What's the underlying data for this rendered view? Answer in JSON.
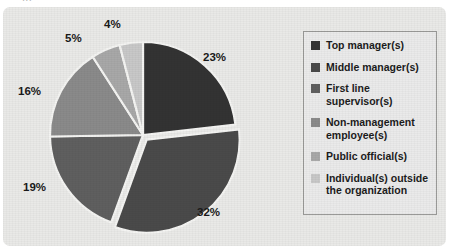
{
  "title_fragment": "...",
  "chart_data": {
    "type": "pie",
    "title": "",
    "xlabel": "",
    "ylabel": "",
    "legend_position": "right",
    "grid": false,
    "explode_index": 1,
    "start_angle_deg": 0,
    "direction": "clockwise",
    "categories": [
      "Top manager(s)",
      "Middle manager(s)",
      "First line supervisor(s)",
      "Non-management employee(s)",
      "Public official(s)",
      "Individual(s) outside the organization"
    ],
    "values": [
      23,
      32,
      19,
      16,
      5,
      4
    ],
    "data_labels": [
      "23%",
      "32%",
      "19%",
      "16%",
      "5%",
      "4%"
    ],
    "colors": [
      "#333333",
      "#4a4a4a",
      "#5f5f5f",
      "#8a8a8a",
      "#a8a8a8",
      "#c8c8c8"
    ]
  },
  "legend": {
    "items": [
      {
        "label": "Top manager(s)",
        "color": "#333333"
      },
      {
        "label": "Middle manager(s)",
        "color": "#4a4a4a"
      },
      {
        "label": "First line supervisor(s)",
        "color": "#5f5f5f"
      },
      {
        "label": "Non-management employee(s)",
        "color": "#8a8a8a"
      },
      {
        "label": "Public official(s)",
        "color": "#a8a8a8"
      },
      {
        "label": "Individual(s) outside the organization",
        "color": "#c8c8c8"
      }
    ]
  },
  "labels": {
    "p23": "23%",
    "p32": "32%",
    "p19": "19%",
    "p16": "16%",
    "p5": "5%",
    "p4": "4%"
  },
  "style": {
    "background": "#e9e9e7",
    "separator": "#f4f4f2"
  }
}
